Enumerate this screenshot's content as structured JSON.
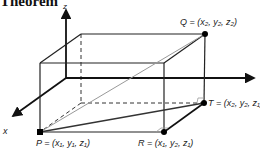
{
  "heading": {
    "text": "Theorem"
  },
  "axes": {
    "z_label": "z",
    "x_label": "x",
    "y_label": "y"
  },
  "points": {
    "P": {
      "name": "P",
      "label": "P = (x₁, y₁, z₁)"
    },
    "Q": {
      "name": "Q",
      "label": "Q = (x₂, y₂, z₂)"
    },
    "R": {
      "name": "R",
      "label": "R = (x₁, y₂, z₁)"
    },
    "T": {
      "name": "T",
      "label": "T = (x₂, y₂, z₁)"
    }
  },
  "colors": {
    "line": "#222222",
    "diagonal": "#999999",
    "point": "#000000"
  }
}
